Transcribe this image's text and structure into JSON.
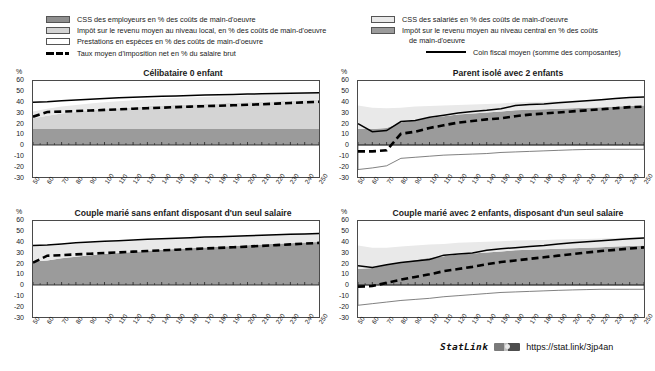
{
  "legend": {
    "left": [
      {
        "icon": "swatch-dark-gray",
        "label": "CSS des employeurs en % des coûts de main-d'oeuvre"
      },
      {
        "icon": "swatch-light-gray",
        "label": "Impôt sur le revenu moyen au niveau local, en % des coûts de main-d'oeuvre"
      },
      {
        "icon": "swatch-white",
        "label": "Prestations en espèces en % des coûts de main-d'oeuvre"
      },
      {
        "icon": "dashed-line",
        "label": "Taux moyen d'imposition net en % du salaire brut"
      }
    ],
    "right": [
      {
        "icon": "swatch-very-light-gray",
        "label": "CSS des salariés en % des coûts de main-d'oeuvre"
      },
      {
        "icon": "swatch-mid-gray",
        "label": "Impôt sur le revenu moyen au niveau central en %  des coûts"
      },
      {
        "icon": "none",
        "label": "de main-d'oeuvre"
      },
      {
        "icon": "solid-line",
        "label": "Coin fiscal moyen (somme des composantes)"
      }
    ]
  },
  "axis_unit": "%",
  "footer": {
    "statlink_label": "StatLink",
    "badge": "statlink-badge-icon",
    "url": "https://stat.link/3jp4an"
  },
  "colors": {
    "employer_sc": "#8f8f8f",
    "local_tax": "#d4d4d4",
    "employee_sc": "#e9e9e9",
    "central_tax": "#9b9b9b",
    "cash_benefits": "#ffffff",
    "net_rate_line": "#000000",
    "tax_wedge_line": "#000000",
    "axis": "#4a4a4a"
  },
  "chart_data": [
    {
      "id": "celibataire-0-enfant",
      "type": "area",
      "title": "Célibataire 0 enfant",
      "xlabel": "",
      "ylabel": "%",
      "xlim": [
        50,
        250
      ],
      "ylim": [
        -30,
        60
      ],
      "yticks": [
        60,
        50,
        40,
        30,
        20,
        10,
        0,
        -10,
        -20,
        -30
      ],
      "x": [
        50,
        60,
        70,
        80,
        90,
        100,
        110,
        120,
        130,
        140,
        150,
        160,
        170,
        180,
        190,
        200,
        210,
        220,
        230,
        240,
        250
      ],
      "grid": false,
      "legend_position": "top",
      "series": [
        {
          "name": "CSS des employeurs en % des coûts de main-d'oeuvre",
          "fill": "#9b9b9b",
          "values": [
            15,
            15,
            15,
            15,
            15,
            15,
            15,
            15,
            15,
            15,
            15,
            15,
            15,
            15,
            15,
            15,
            15,
            15,
            15,
            15,
            15
          ]
        },
        {
          "name": "Impôt sur le revenu moyen au niveau central en % des coûts",
          "fill": "#d4d4d4",
          "values": [
            10,
            12.5,
            14.5,
            16,
            17.5,
            18.5,
            19.5,
            20.5,
            21.5,
            22,
            22.5,
            23,
            23.5,
            24,
            24.5,
            25,
            25.5,
            26,
            26.5,
            27,
            27.5
          ]
        },
        {
          "name": "CSS des salariés en % des coûts de main-d'oeuvre",
          "fill": "#e9e9e9",
          "values": [
            6.5,
            6.5,
            6.5,
            6.5,
            6.5,
            6.5,
            6.5,
            6.5,
            6.5,
            6.5,
            6.5,
            6.5,
            6.5,
            6.5,
            6.5,
            6.5,
            6.5,
            6.5,
            6.5,
            6.5,
            6.5
          ]
        },
        {
          "name": "Prestations en espèces en % des coûts de main-d'oeuvre",
          "fill": "#ffffff",
          "values": [
            0,
            0,
            0,
            0,
            0,
            0,
            0,
            0,
            0,
            0,
            0,
            0,
            0,
            0,
            0,
            0,
            0,
            0,
            0,
            0,
            0
          ]
        }
      ],
      "lines": [
        {
          "name": "Coin fiscal moyen (somme des composantes)",
          "style": "solid",
          "values": [
            40,
            40.5,
            41.5,
            42.3,
            43,
            43.7,
            44.2,
            44.7,
            45.2,
            45.6,
            46,
            46.4,
            46.8,
            47.1,
            47.4,
            47.7,
            48,
            48.3,
            48.6,
            48.8,
            49
          ]
        },
        {
          "name": "Taux moyen d'imposition net en % du salaire brut",
          "style": "dashed",
          "values": [
            26.5,
            31,
            31.3,
            31.8,
            32.3,
            32.9,
            33.4,
            34,
            34.5,
            35,
            35.5,
            36,
            36.4,
            36.8,
            37.2,
            37.7,
            38.2,
            38.8,
            39.4,
            40,
            40.5
          ]
        }
      ]
    },
    {
      "id": "parent-isole-2-enfants",
      "type": "area",
      "title": "Parent isolé avec 2 enfants",
      "xlabel": "",
      "ylabel": "%",
      "xlim": [
        50,
        250
      ],
      "ylim": [
        -30,
        60
      ],
      "yticks": [
        60,
        50,
        40,
        30,
        20,
        10,
        0,
        -10,
        -20,
        -30
      ],
      "x": [
        50,
        60,
        70,
        80,
        90,
        100,
        110,
        120,
        130,
        140,
        150,
        160,
        170,
        180,
        190,
        200,
        210,
        220,
        230,
        240,
        250
      ],
      "grid": false,
      "legend_position": "top",
      "series": [
        {
          "name": "CSS des employeurs en % des coûts de main-d'oeuvre",
          "fill": "#9b9b9b",
          "values": [
            15,
            15,
            15,
            15,
            15,
            15,
            15,
            15,
            15,
            15,
            15,
            15,
            15,
            15,
            15,
            15,
            15,
            15,
            15,
            15,
            15
          ]
        },
        {
          "name": "Impôt sur le revenu moyen au niveau central en % des coûts",
          "fill": "#9b9b9b",
          "values": [
            0,
            0,
            1,
            6,
            8.5,
            10.5,
            12,
            13.5,
            14.5,
            15.5,
            16.5,
            17.5,
            18,
            18.5,
            19,
            19.5,
            20,
            20.5,
            21,
            21.5,
            22
          ]
        },
        {
          "name": "CSS des salariés en % des coûts de main-d'oeuvre",
          "fill": "#e9e9e9",
          "values": [
            22,
            20,
            18.5,
            14,
            12.5,
            11,
            10,
            9,
            8.5,
            8,
            7.5,
            7.3,
            7.2,
            7.1,
            7,
            7,
            7,
            7,
            7,
            7,
            7
          ]
        },
        {
          "name": "Prestations en espèces en % des coûts de main-d'oeuvre",
          "fill": "#ffffff",
          "values": [
            -23,
            -21.5,
            -19.5,
            -12.5,
            -11.5,
            -10.5,
            -9.5,
            -9,
            -8.5,
            -8,
            -7,
            -6.5,
            -6,
            -5.5,
            -5,
            -4.5,
            -4.2,
            -4,
            -4,
            -4,
            -4
          ]
        }
      ],
      "lines": [
        {
          "name": "Coin fiscal moyen (somme des composantes)",
          "style": "solid",
          "values": [
            20,
            12.5,
            13.5,
            22,
            23,
            26,
            28,
            30,
            31.5,
            32.5,
            34,
            37,
            38,
            38.5,
            39.5,
            40.5,
            41.5,
            42.5,
            43.5,
            44.5,
            45
          ]
        },
        {
          "name": "Taux moyen d'imposition net en % du salaire brut",
          "style": "dashed",
          "values": [
            -6,
            -6,
            -5,
            10.5,
            12.5,
            16,
            18.5,
            21,
            22.5,
            24,
            25,
            27,
            28.5,
            29.5,
            30.5,
            31.5,
            32.5,
            33.5,
            34.5,
            35.5,
            36
          ]
        }
      ]
    },
    {
      "id": "couple-marie-sans-enfant",
      "type": "area",
      "title": "Couple marié sans enfant disposant d'un seul salaire",
      "xlabel": "",
      "ylabel": "%",
      "xlim": [
        50,
        250
      ],
      "ylim": [
        -30,
        60
      ],
      "yticks": [
        60,
        50,
        40,
        30,
        20,
        10,
        0,
        -10,
        -20,
        -30
      ],
      "x": [
        50,
        60,
        70,
        80,
        90,
        100,
        110,
        120,
        130,
        140,
        150,
        160,
        170,
        180,
        190,
        200,
        210,
        220,
        230,
        240,
        250
      ],
      "grid": false,
      "legend_position": "top",
      "series": [
        {
          "name": "CSS des employeurs en % des coûts de main-d'oeuvre",
          "fill": "#9b9b9b",
          "values": [
            15,
            15,
            15,
            15,
            15,
            15,
            15,
            15,
            15,
            15,
            15,
            15,
            15,
            15,
            15,
            15,
            15,
            15,
            15,
            15,
            15
          ]
        },
        {
          "name": "Impôt sur le revenu moyen au niveau central en % des coûts",
          "fill": "#9b9b9b",
          "values": [
            7,
            8,
            10,
            11.5,
            13,
            14,
            15,
            16,
            17,
            18,
            18.8,
            19.5,
            20.2,
            20.8,
            21.5,
            22.2,
            23,
            23.6,
            24.2,
            24.8,
            25.3
          ]
        },
        {
          "name": "CSS des salariés en % des coûts de main-d'oeuvre",
          "fill": "#e9e9e9",
          "values": [
            14.5,
            13.5,
            12.5,
            12,
            11.5,
            11,
            10.5,
            10.2,
            10,
            9.8,
            9.6,
            9.4,
            9.2,
            9,
            9,
            9,
            9,
            9,
            9,
            9,
            9
          ]
        },
        {
          "name": "Prestations en espèces en % des coûts de main-d'oeuvre",
          "fill": "#ffffff",
          "values": [
            0,
            0,
            0,
            0,
            0,
            0,
            0,
            0,
            0,
            0,
            0,
            0,
            0,
            0,
            0,
            0,
            0,
            0,
            0,
            0,
            0
          ]
        }
      ],
      "lines": [
        {
          "name": "Coin fiscal moyen (somme des composantes)",
          "style": "solid",
          "values": [
            37,
            37.5,
            38.5,
            39.5,
            40.3,
            41,
            41.6,
            42.2,
            42.8,
            43.4,
            43.9,
            44.4,
            44.9,
            45.3,
            45.8,
            46.2,
            46.7,
            47.1,
            47.5,
            47.8,
            48.2
          ]
        },
        {
          "name": "Taux moyen d'imposition net en % du salaire brut",
          "style": "dashed",
          "values": [
            21,
            27.5,
            28,
            28.7,
            29.3,
            30,
            30.6,
            31.3,
            31.9,
            32.5,
            33.1,
            33.7,
            34.2,
            34.8,
            35.4,
            36,
            36.7,
            37.4,
            38.1,
            38.8,
            39.5
          ]
        }
      ]
    },
    {
      "id": "couple-marie-2-enfants",
      "type": "area",
      "title": "Couple marié avec 2 enfants, disposant d'un seul salaire",
      "xlabel": "",
      "ylabel": "%",
      "xlim": [
        50,
        250
      ],
      "ylim": [
        -30,
        60
      ],
      "yticks": [
        60,
        50,
        40,
        30,
        20,
        10,
        0,
        -10,
        -20,
        -30
      ],
      "x": [
        50,
        60,
        70,
        80,
        90,
        100,
        110,
        120,
        130,
        140,
        150,
        160,
        170,
        180,
        190,
        200,
        210,
        220,
        230,
        240,
        250
      ],
      "grid": false,
      "legend_position": "top",
      "series": [
        {
          "name": "CSS des employeurs en % des coûts de main-d'oeuvre",
          "fill": "#9b9b9b",
          "values": [
            15,
            15,
            15,
            15,
            15,
            15,
            15,
            15,
            15,
            15,
            15,
            15,
            15,
            15,
            15,
            15,
            15,
            15,
            15,
            15,
            15
          ]
        },
        {
          "name": "Impôt sur le revenu moyen au niveau central en % des coûts",
          "fill": "#9b9b9b",
          "values": [
            0,
            1,
            4,
            6.5,
            8.5,
            10.5,
            12,
            13.5,
            14.5,
            15.5,
            16.5,
            17.5,
            18,
            18.5,
            19,
            19.5,
            20,
            20.5,
            21,
            21.5,
            22
          ]
        },
        {
          "name": "CSS des salariés en % des coûts de main-d'oeuvre",
          "fill": "#e9e9e9",
          "values": [
            22,
            19,
            16,
            14.5,
            13.5,
            12.5,
            11.5,
            11,
            10.5,
            10,
            9.5,
            9.2,
            9,
            8.8,
            8.6,
            8.4,
            8.2,
            8,
            8,
            8,
            8
          ]
        },
        {
          "name": "Prestations en espèces en % des coûts de main-d'oeuvre",
          "fill": "#ffffff",
          "values": [
            -19,
            -17.5,
            -16,
            -14.5,
            -13.5,
            -12.5,
            -11,
            -10,
            -9,
            -8,
            -7,
            -6.5,
            -6,
            -5.5,
            -5,
            -4.6,
            -4.3,
            -4,
            -4,
            -4,
            -4
          ]
        }
      ],
      "lines": [
        {
          "name": "Coin fiscal moyen (somme des composantes)",
          "style": "solid",
          "values": [
            18,
            16.5,
            19,
            21,
            22.5,
            24,
            28,
            29,
            30,
            32.5,
            34,
            35,
            36,
            37,
            38.5,
            39.5,
            40.5,
            41.5,
            42.5,
            43.3,
            44
          ]
        },
        {
          "name": "Taux moyen d'imposition net en % du salaire brut",
          "style": "dashed",
          "values": [
            -1.5,
            -1,
            2,
            5,
            7.5,
            10,
            13,
            15,
            17,
            19.5,
            21.5,
            23,
            24.5,
            26,
            27.5,
            29,
            30.5,
            31.8,
            33,
            34.2,
            35.3
          ]
        }
      ]
    }
  ]
}
